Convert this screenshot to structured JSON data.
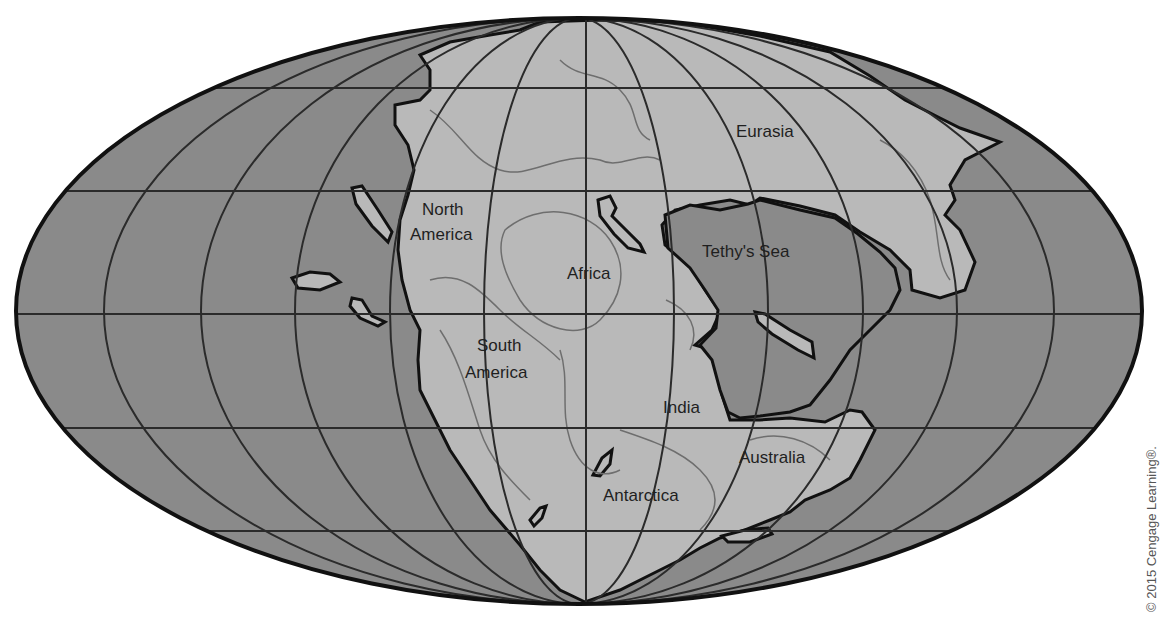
{
  "map": {
    "title": "Pangaea supercontinent (Mollweide projection)",
    "projection": "mollweide",
    "colors": {
      "ocean": "#8a8a8a",
      "ocean_inner": "#7f7f7f",
      "land": "#b9b9b9",
      "coastline": "#111111",
      "contour": "#6e6e6e",
      "graticule": "#2b2b2b",
      "background": "#ffffff"
    },
    "labels": [
      {
        "id": "eurasia",
        "text": "Eurasia",
        "x": 736,
        "y": 137
      },
      {
        "id": "north-america-1",
        "text": "North",
        "x": 422,
        "y": 215
      },
      {
        "id": "north-america-2",
        "text": "America",
        "x": 410,
        "y": 240
      },
      {
        "id": "africa",
        "text": "Africa",
        "x": 567,
        "y": 279
      },
      {
        "id": "tethys-sea",
        "text": "Tethy's Sea",
        "x": 702,
        "y": 257
      },
      {
        "id": "south-america-1",
        "text": "South",
        "x": 477,
        "y": 351
      },
      {
        "id": "south-america-2",
        "text": "America",
        "x": 465,
        "y": 378
      },
      {
        "id": "india",
        "text": "India",
        "x": 663,
        "y": 413
      },
      {
        "id": "australia",
        "text": "Australia",
        "x": 739,
        "y": 463
      },
      {
        "id": "antarctica",
        "text": "Antarctica",
        "x": 603,
        "y": 501
      }
    ],
    "labels_text": {
      "eurasia": "Eurasia",
      "north_america": "North America",
      "africa": "Africa",
      "tethys_sea": "Tethy's Sea",
      "south_america": "South America",
      "india": "India",
      "australia": "Australia",
      "antarctica": "Antarctica"
    }
  },
  "copyright": "© 2015 Cengage Learning®."
}
